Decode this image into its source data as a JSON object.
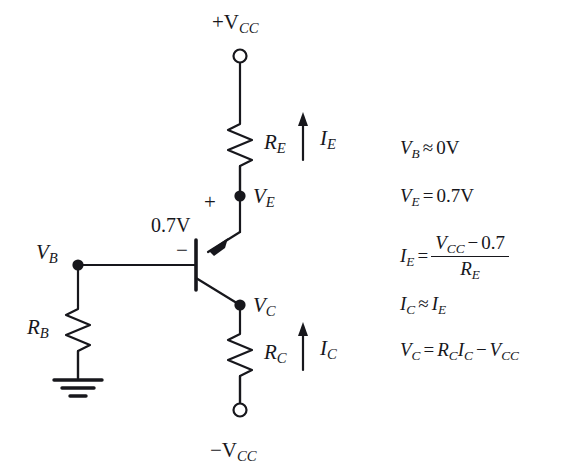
{
  "diagram": {
    "colors": {
      "ink": "#17171c",
      "background": "#ffffff"
    },
    "terminals": {
      "top_supply": "+V",
      "top_supply_sub": "CC",
      "bottom_supply": "−V",
      "bottom_supply_sub": "CC"
    },
    "nodes": {
      "ve_label": "V",
      "ve_sub": "E",
      "vc_label": "V",
      "vc_sub": "C",
      "vb_label": "V",
      "vb_sub": "B"
    },
    "components": {
      "re_label": "R",
      "re_sub": "E",
      "rc_label": "R",
      "rc_sub": "C",
      "rb_label": "R",
      "rb_sub": "B"
    },
    "currents": {
      "ie_label": "I",
      "ie_sub": "E",
      "ic_label": "I",
      "ic_sub": "C"
    },
    "junction": {
      "vbe_value": "0.7V",
      "plus_sign": "+",
      "minus_sign": "−"
    },
    "ground": {
      "name": "ground-symbol"
    }
  },
  "equations": [
    {
      "id": "vb",
      "lhs": "V",
      "lhs_sub": "B",
      "op": "≈",
      "rhs": "0V"
    },
    {
      "id": "ve",
      "lhs": "V",
      "lhs_sub": "E",
      "op": "=",
      "rhs": "0.7V"
    },
    {
      "id": "ie",
      "lhs": "I",
      "lhs_sub": "E",
      "op": "=",
      "numerator_var": "V",
      "numerator_sub": "CC",
      "numerator_op": "−",
      "numerator_const": "0.7",
      "denominator_var": "R",
      "denominator_sub": "E"
    },
    {
      "id": "ic",
      "lhs": "I",
      "lhs_sub": "C",
      "op": "≈",
      "rhs_var": "I",
      "rhs_sub": "E"
    },
    {
      "id": "vc",
      "lhs": "V",
      "lhs_sub": "C",
      "op": "=",
      "term1_var": "R",
      "term1_sub": "C",
      "term2_var": "I",
      "term2_sub": "C",
      "mid_op": "−",
      "term3_var": "V",
      "term3_sub": "CC"
    }
  ]
}
